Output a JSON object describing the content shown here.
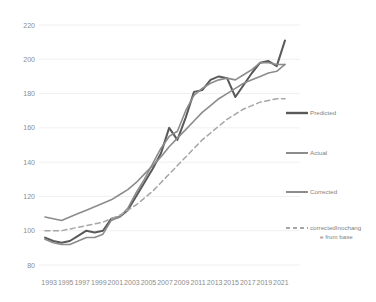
{
  "chart_data": {
    "type": "line",
    "title": "",
    "xlabel": "",
    "ylabel": "",
    "ylim": [
      80,
      220
    ],
    "ytick_values": [
      80,
      100,
      120,
      140,
      160,
      180,
      200,
      220
    ],
    "grid": true,
    "legend_position": "right",
    "x": [
      1993,
      1994,
      1995,
      1996,
      1997,
      1998,
      1999,
      2000,
      2001,
      2002,
      2003,
      2004,
      2005,
      2006,
      2007,
      2008,
      2009,
      2010,
      2011,
      2012,
      2013,
      2014,
      2015,
      2016,
      2017,
      2018,
      2019,
      2020,
      2021,
      2022
    ],
    "xtick_labels": [
      "1993",
      "1995",
      "1997",
      "1999",
      "2001",
      "2003",
      "2005",
      "2007",
      "2009",
      "2011",
      "2013",
      "2015",
      "2017",
      "2019",
      "2021"
    ],
    "series": [
      {
        "name": "Predicted",
        "color": "#595959",
        "dash": "none",
        "width": 2.0,
        "values": [
          96,
          94,
          93,
          94,
          97,
          100,
          99,
          100,
          107,
          108,
          112,
          120,
          128,
          136,
          145,
          160,
          153,
          166,
          181,
          182,
          188,
          190,
          189,
          178,
          185,
          192,
          198,
          199,
          196,
          211
        ]
      },
      {
        "name": "Actual",
        "color": "#8c8c8c",
        "dash": "none",
        "width": 1.6,
        "values": [
          95,
          93,
          92,
          92,
          94,
          96,
          96,
          98,
          106,
          108,
          113,
          122,
          130,
          139,
          148,
          155,
          158,
          170,
          179,
          183,
          186,
          188,
          189,
          188,
          191,
          194,
          198,
          198,
          197,
          197
        ]
      },
      {
        "name": "Corrected",
        "color": "#8c8c8c",
        "dash": "none",
        "width": 1.6,
        "values": [
          108,
          107,
          106,
          108,
          110,
          112,
          114,
          116,
          118,
          121,
          124,
          128,
          133,
          138,
          143,
          149,
          154,
          159,
          164,
          169,
          173,
          177,
          180,
          183,
          186,
          188,
          190,
          192,
          193,
          197
        ]
      },
      {
        "name": "correctedInochange from base",
        "color": "#a6a6a6",
        "dash": "dashed",
        "width": 1.5,
        "values": [
          100,
          100,
          100,
          101,
          102,
          103,
          104,
          105,
          107,
          109,
          112,
          115,
          119,
          123,
          128,
          133,
          138,
          143,
          148,
          153,
          157,
          161,
          165,
          168,
          171,
          173,
          175,
          176,
          177,
          177
        ]
      }
    ]
  },
  "legend": {
    "items": [
      {
        "label": "Predicted"
      },
      {
        "label": "Actual"
      },
      {
        "label": "Corrected"
      },
      {
        "label_line1": "correctedInochang",
        "label_line2": "e from base"
      }
    ]
  },
  "colors": {
    "predicted": "#595959",
    "actual": "#8c8c8c",
    "corrected": "#8c8c8c",
    "corrected_nochange": "#a6a6a6",
    "gridline": "#e8e8e8",
    "axis_text": "#8c8c8c",
    "background": "#ffffff"
  }
}
